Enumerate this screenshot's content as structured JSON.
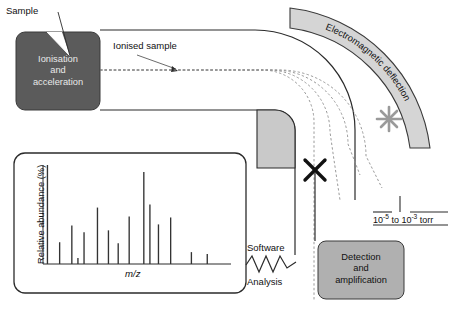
{
  "diagram": {
    "labels": {
      "sample": "Sample",
      "ionised_sample": "Ionised sample",
      "electromagnetic_deflection": "Electromagnetic deflection",
      "software": "Software",
      "analysis": "Analysis"
    },
    "ionisation_box": {
      "line1": "Ionisation",
      "line2": "and",
      "line3": "acceleration",
      "fill": "#5b5b5b",
      "text_color": "#ededed"
    },
    "detection_box": {
      "line1": "Detection",
      "line2": "and",
      "line3": "amplification",
      "fill": "#b0b0b0",
      "text_color": "#111111"
    },
    "pressure": {
      "prefix": "10",
      "exp1": "-5",
      "middle": " to 10",
      "exp2": "-3",
      "suffix": " torr"
    },
    "colors": {
      "arc_fill": "#d5d5d5",
      "arc_stroke": "#3a3a3a",
      "tube_stroke": "#2b2b2b",
      "corner_fill": "#c9c9c9",
      "trajectory": "#8f8f8f",
      "marker_black": "#111111",
      "marker_gray": "#9a9a9a"
    },
    "markers": {
      "black_x": "flight-path-x-marker",
      "gray_x": "deflection-x-marker"
    }
  },
  "chart_data": {
    "type": "bar",
    "title": "",
    "xlabel": "m/z",
    "ylabel": "Relative abundance (%)",
    "ylim": [
      0,
      100
    ],
    "grid": false,
    "legend": null,
    "categories": [
      "1",
      "2",
      "3",
      "4",
      "5",
      "6",
      "7",
      "8",
      "9",
      "10",
      "11",
      "12",
      "13",
      "14",
      "15",
      "16"
    ],
    "values": [
      100,
      22,
      39,
      6,
      32,
      57,
      34,
      21,
      48,
      93,
      60,
      40,
      47,
      12,
      10,
      0
    ],
    "x_positions": [
      2,
      12,
      22,
      27,
      32,
      43,
      52,
      60,
      69,
      81,
      86,
      93,
      103,
      120,
      133,
      145
    ]
  }
}
